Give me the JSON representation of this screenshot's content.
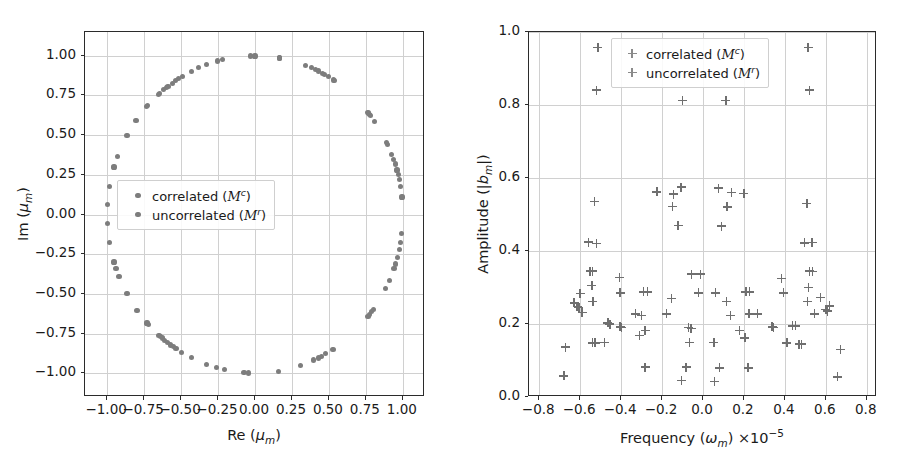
{
  "figure": {
    "width": 908,
    "height": 470,
    "background": "#ffffff",
    "marker_color": "#7d7d7d",
    "grid_color": "#d0d0d0",
    "axis_color": "#2b2b2b"
  },
  "panels": [
    {
      "id": "left",
      "legend": {
        "entries": [
          {
            "label": "correlated",
            "symbol_text": "(M^c)",
            "marker": "dot-marker"
          },
          {
            "label": "uncorrelated",
            "symbol_text": "(M^r)",
            "marker": "dot-marker"
          }
        ]
      }
    },
    {
      "id": "right",
      "legend": {
        "entries": [
          {
            "label": "correlated",
            "symbol_text": "(M^c)",
            "marker": "plus-marker"
          },
          {
            "label": "uncorrelated",
            "symbol_text": "(M^r)",
            "marker": "plus-marker"
          }
        ]
      }
    }
  ],
  "chart_data": [
    {
      "type": "scatter",
      "id": "eigenvalue-unit-circle",
      "title": "",
      "xlabel": "Re (μ_m)",
      "ylabel": "Im (μ_m)",
      "xlim": [
        -1.15,
        1.15
      ],
      "ylim": [
        -1.15,
        1.15
      ],
      "xticks": [
        -1.0,
        -0.75,
        -0.5,
        -0.25,
        0.0,
        0.25,
        0.5,
        0.75,
        1.0
      ],
      "yticks": [
        -1.0,
        -0.75,
        -0.5,
        -0.25,
        0.0,
        0.25,
        0.5,
        0.75,
        1.0
      ],
      "xticklabels": [
        "-1.00",
        "-0.75",
        "-0.50",
        "-0.25",
        "0.00",
        "0.25",
        "0.50",
        "0.75",
        "1.00"
      ],
      "yticklabels": [
        "-1.00",
        "-0.75",
        "-0.50",
        "-0.25",
        "0.00",
        "0.25",
        "0.50",
        "0.75",
        "1.00"
      ],
      "grid": true,
      "legend_position": "center-left",
      "legend_entries": [
        "correlated (M^c)",
        "uncorrelated (M^r)"
      ],
      "marker": "o",
      "series": [
        {
          "name": "eigenvalues",
          "points": [
            [
              0.165,
              0.986
            ],
            [
              0.0,
              0.999
            ],
            [
              -0.03,
              0.999
            ],
            [
              -0.218,
              0.976
            ],
            [
              -0.253,
              0.967
            ],
            [
              -0.33,
              0.944
            ],
            [
              -0.38,
              0.925
            ],
            [
              -0.432,
              0.902
            ],
            [
              -0.492,
              0.871
            ],
            [
              -0.518,
              0.855
            ],
            [
              -0.538,
              0.843
            ],
            [
              -0.56,
              0.828
            ],
            [
              -0.588,
              0.809
            ],
            [
              -0.6,
              0.8
            ],
            [
              -0.618,
              0.786
            ],
            [
              -0.645,
              0.764
            ],
            [
              -0.655,
              0.755
            ],
            [
              -0.725,
              0.689
            ],
            [
              -0.735,
              0.678
            ],
            [
              -0.805,
              0.593
            ],
            [
              -0.866,
              0.5
            ],
            [
              -0.93,
              0.368
            ],
            [
              -0.954,
              0.299
            ],
            [
              -0.985,
              0.174
            ],
            [
              -0.998,
              0.063
            ],
            [
              -0.998,
              -0.056
            ],
            [
              -0.985,
              -0.174
            ],
            [
              -0.954,
              -0.299
            ],
            [
              -0.94,
              -0.342
            ],
            [
              -0.92,
              -0.391
            ],
            [
              -0.866,
              -0.5
            ],
            [
              -0.798,
              -0.603
            ],
            [
              -0.73,
              -0.684
            ],
            [
              -0.72,
              -0.694
            ],
            [
              -0.65,
              -0.76
            ],
            [
              -0.64,
              -0.768
            ],
            [
              -0.628,
              -0.778
            ],
            [
              -0.61,
              -0.792
            ],
            [
              -0.592,
              -0.806
            ],
            [
              -0.57,
              -0.822
            ],
            [
              -0.552,
              -0.834
            ],
            [
              -0.535,
              -0.845
            ],
            [
              -0.496,
              -0.868
            ],
            [
              -0.43,
              -0.903
            ],
            [
              -0.33,
              -0.944
            ],
            [
              -0.258,
              -0.966
            ],
            [
              -0.208,
              -0.978
            ],
            [
              -0.075,
              -0.997
            ],
            [
              -0.045,
              -0.999
            ],
            [
              0.16,
              -0.987
            ],
            [
              0.308,
              -0.951
            ],
            [
              0.398,
              -0.917
            ],
            [
              0.428,
              -0.904
            ],
            [
              0.45,
              -0.893
            ],
            [
              0.478,
              -0.878
            ],
            [
              0.528,
              -0.849
            ],
            [
              0.765,
              -0.644
            ],
            [
              0.775,
              -0.632
            ],
            [
              0.79,
              -0.613
            ],
            [
              0.8,
              -0.6
            ],
            [
              0.884,
              -0.468
            ],
            [
              0.91,
              -0.415
            ],
            [
              0.94,
              -0.342
            ],
            [
              0.95,
              -0.312
            ],
            [
              0.963,
              -0.27
            ],
            [
              0.975,
              -0.222
            ],
            [
              0.985,
              -0.174
            ],
            [
              0.993,
              -0.118
            ],
            [
              0.994,
              0.11
            ],
            [
              0.985,
              0.174
            ],
            [
              0.975,
              0.222
            ],
            [
              0.968,
              0.25
            ],
            [
              0.96,
              0.28
            ],
            [
              0.948,
              0.318
            ],
            [
              0.938,
              0.347
            ],
            [
              0.925,
              0.38
            ],
            [
              0.898,
              0.44
            ],
            [
              0.89,
              0.456
            ],
            [
              0.81,
              0.586
            ],
            [
              0.782,
              0.623
            ],
            [
              0.776,
              0.631
            ],
            [
              0.77,
              0.638
            ],
            [
              0.764,
              0.645
            ],
            [
              0.54,
              0.842
            ],
            [
              0.532,
              0.847
            ],
            [
              0.497,
              0.868
            ],
            [
              0.47,
              0.883
            ],
            [
              0.455,
              0.891
            ],
            [
              0.428,
              0.904
            ],
            [
              0.41,
              0.912
            ],
            [
              0.38,
              0.925
            ],
            [
              0.34,
              0.94
            ],
            [
              0.165,
              0.986
            ]
          ]
        }
      ]
    },
    {
      "type": "scatter",
      "id": "amplitude-vs-frequency",
      "title": "",
      "xlabel": "Frequency (ω_m) ×10⁻⁵",
      "ylabel": "Amplitude (|b_m|)",
      "xlim": [
        -0.85,
        0.85
      ],
      "ylim": [
        0.0,
        1.0
      ],
      "xticks": [
        -0.8,
        -0.6,
        -0.4,
        -0.2,
        0.0,
        0.2,
        0.4,
        0.6,
        0.8
      ],
      "yticks": [
        0.0,
        0.2,
        0.4,
        0.6,
        0.8,
        1.0
      ],
      "xticklabels": [
        "-0.8",
        "-0.6",
        "-0.4",
        "-0.2",
        "0.0",
        "0.2",
        "0.4",
        "0.6",
        "0.8"
      ],
      "yticklabels": [
        "0.0",
        "0.2",
        "0.4",
        "0.6",
        "0.8",
        "1.0"
      ],
      "grid": true,
      "legend_position": "upper-center",
      "legend_entries": [
        "correlated (M^c)",
        "uncorrelated (M^r)"
      ],
      "marker": "+",
      "series": [
        {
          "name": "modes",
          "points": [
            [
              -0.513,
              0.957
            ],
            [
              0.513,
              0.957
            ],
            [
              -0.52,
              0.841
            ],
            [
              0.52,
              0.841
            ],
            [
              -0.1,
              0.812
            ],
            [
              0.112,
              0.812
            ],
            [
              -0.107,
              0.575
            ],
            [
              0.075,
              0.572
            ],
            [
              -0.225,
              0.562
            ],
            [
              -0.143,
              0.556
            ],
            [
              0.14,
              0.56
            ],
            [
              0.2,
              0.558
            ],
            [
              -0.53,
              0.535
            ],
            [
              0.508,
              0.53
            ],
            [
              -0.148,
              0.522
            ],
            [
              0.118,
              0.521
            ],
            [
              -0.122,
              0.47
            ],
            [
              0.09,
              0.468
            ],
            [
              -0.56,
              0.424
            ],
            [
              -0.52,
              0.421
            ],
            [
              0.497,
              0.422
            ],
            [
              0.533,
              0.423
            ],
            [
              -0.552,
              0.345
            ],
            [
              -0.54,
              0.345
            ],
            [
              0.52,
              0.345
            ],
            [
              0.536,
              0.344
            ],
            [
              -0.055,
              0.337
            ],
            [
              -0.012,
              0.337
            ],
            [
              -0.407,
              0.327
            ],
            [
              0.383,
              0.325
            ],
            [
              -0.543,
              0.305
            ],
            [
              0.515,
              0.3
            ],
            [
              -0.6,
              0.283
            ],
            [
              -0.405,
              0.285
            ],
            [
              -0.29,
              0.288
            ],
            [
              -0.27,
              0.288
            ],
            [
              -0.022,
              0.285
            ],
            [
              0.06,
              0.285
            ],
            [
              0.21,
              0.288
            ],
            [
              0.228,
              0.288
            ],
            [
              0.393,
              0.285
            ],
            [
              -0.538,
              0.262
            ],
            [
              0.51,
              0.262
            ],
            [
              -0.63,
              0.258
            ],
            [
              -0.155,
              0.27
            ],
            [
              0.573,
              0.272
            ],
            [
              -0.615,
              0.248
            ],
            [
              -0.606,
              0.245
            ],
            [
              0.115,
              0.262
            ],
            [
              0.617,
              0.25
            ],
            [
              0.6,
              0.24
            ],
            [
              -0.59,
              0.232
            ],
            [
              -0.33,
              0.228
            ],
            [
              -0.3,
              0.223
            ],
            [
              -0.178,
              0.228
            ],
            [
              0.135,
              0.223
            ],
            [
              0.225,
              0.228
            ],
            [
              0.265,
              0.228
            ],
            [
              0.545,
              0.228
            ],
            [
              0.608,
              0.235
            ],
            [
              -0.465,
              0.203
            ],
            [
              -0.455,
              0.2
            ],
            [
              -0.405,
              0.192
            ],
            [
              -0.398,
              0.19
            ],
            [
              -0.283,
              0.182
            ],
            [
              -0.07,
              0.19
            ],
            [
              -0.058,
              0.188
            ],
            [
              0.178,
              0.182
            ],
            [
              0.338,
              0.192
            ],
            [
              0.345,
              0.19
            ],
            [
              0.438,
              0.195
            ],
            [
              0.452,
              0.195
            ],
            [
              -0.31,
              0.168
            ],
            [
              0.205,
              0.162
            ],
            [
              -0.54,
              0.148
            ],
            [
              -0.527,
              0.148
            ],
            [
              -0.48,
              0.15
            ],
            [
              -0.065,
              0.15
            ],
            [
              0.053,
              0.15
            ],
            [
              0.41,
              0.148
            ],
            [
              0.47,
              0.145
            ],
            [
              0.482,
              0.145
            ],
            [
              -0.672,
              0.137
            ],
            [
              0.672,
              0.13
            ],
            [
              -0.283,
              0.082
            ],
            [
              -0.083,
              0.082
            ],
            [
              0.08,
              0.08
            ],
            [
              0.22,
              0.08
            ],
            [
              -0.105,
              0.045
            ],
            [
              0.057,
              0.043
            ],
            [
              -0.68,
              0.058
            ],
            [
              0.658,
              0.055
            ]
          ]
        }
      ]
    }
  ]
}
